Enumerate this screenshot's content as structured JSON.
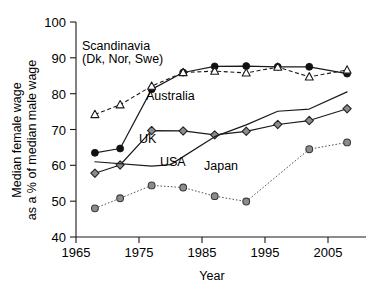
{
  "chart_data": {
    "type": "line",
    "title": "",
    "xlabel": "Year",
    "ylabel": "Median female wage as a % of median male wage",
    "ylabel_line1": "Median female wage",
    "ylabel_line2": "as a % of median male wage",
    "xlim": [
      1963,
      2009
    ],
    "ylim": [
      40,
      100
    ],
    "xticks": [
      1965,
      1975,
      1985,
      1995,
      2005
    ],
    "xticklabels": [
      "1965",
      "1975",
      "1985",
      "1995",
      "2005"
    ],
    "yticks": [
      40,
      50,
      60,
      70,
      80,
      90,
      100
    ],
    "yticklabels": [
      "40",
      "50",
      "60",
      "70",
      "80",
      "90",
      "100"
    ],
    "grid": false,
    "legend_position": "inline-annotations",
    "series": [
      {
        "name": "Scandinavia (Dk, Nor, Swe)",
        "label": "Scandinavia",
        "label_line2": "(Dk, Nor, Swe)",
        "marker": "filled-circle",
        "linestyle": "solid",
        "color": "#111111",
        "x": [
          1966,
          1970,
          1975,
          1980,
          1985,
          1990,
          1995,
          2000,
          2006
        ],
        "y": [
          63.5,
          64.7,
          81.2,
          85.9,
          87.6,
          87.7,
          87.5,
          87.5,
          85.6
        ]
      },
      {
        "name": "Australia",
        "label": "Australia",
        "marker": "open-triangle",
        "linestyle": "dashed",
        "color": "#1a1a1a",
        "x": [
          1966,
          1970,
          1975,
          1980,
          1985,
          1990,
          1995,
          2000,
          2006
        ],
        "y": [
          74.2,
          76.9,
          82.1,
          85.9,
          86.3,
          85.8,
          87.4,
          84.7,
          86.6
        ]
      },
      {
        "name": "UK",
        "label": "UK",
        "marker": "gray-diamond",
        "linestyle": "solid",
        "color": "#8c8c8c",
        "x": [
          1966,
          1970,
          1975,
          1980,
          1985,
          1990,
          1995,
          2000,
          2006
        ],
        "y": [
          57.8,
          60.1,
          69.7,
          69.6,
          68.5,
          69.5,
          71.4,
          72.5,
          75.8
        ]
      },
      {
        "name": "USA",
        "label": "USA",
        "marker": "none",
        "linestyle": "solid",
        "color": "#1a1a1a",
        "x": [
          1966,
          1975,
          1978,
          1985,
          1990,
          1995,
          2000,
          2006
        ],
        "y": [
          61.0,
          59.8,
          60.2,
          68.0,
          71.3,
          75.1,
          75.7,
          80.5
        ]
      },
      {
        "name": "Japan",
        "label": "Japan",
        "marker": "gray-circle",
        "linestyle": "dotted",
        "color": "#8c8c8c",
        "x": [
          1966,
          1970,
          1975,
          1980,
          1985,
          1990,
          2000,
          2006
        ],
        "y": [
          48.0,
          50.8,
          54.4,
          53.8,
          51.4,
          49.9,
          64.5,
          66.4
        ]
      }
    ],
    "annotations": [
      {
        "text": "Scandinavia",
        "x_px": 82,
        "y_px": 50
      },
      {
        "text": "(Dk, Nor, Swe)",
        "x_px": 82,
        "y_px": 63
      },
      {
        "text": "Australia",
        "x_px": 146,
        "y_px": 100
      },
      {
        "text": "UK",
        "x_px": 139,
        "y_px": 143
      },
      {
        "text": "USA",
        "x_px": 160,
        "y_px": 166
      },
      {
        "text": "Japan",
        "x_px": 204,
        "y_px": 170
      }
    ]
  }
}
